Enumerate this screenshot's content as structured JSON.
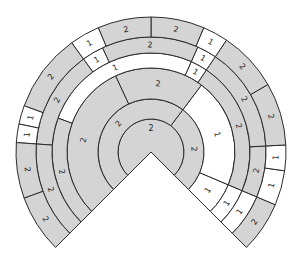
{
  "diagram": {
    "type": "concentric-ring-fan",
    "center": [
      151,
      152
    ],
    "sweep_degrees": [
      -45,
      225
    ],
    "colors": {
      "shaded": "#d4d4d4",
      "white": "#ffffff",
      "stroke": "#2b2b2b",
      "text": "#222222"
    },
    "rings": [
      {
        "name": "disc",
        "r0": 0,
        "r1": 33,
        "segments": [
          {
            "a0": -45,
            "a1": 225,
            "label": "2",
            "fill": "shaded"
          }
        ]
      },
      {
        "name": "ring-a",
        "r0": 33,
        "r1": 53,
        "segments": [
          {
            "a0": -45,
            "a1": 53,
            "label": "2",
            "fill": "shaded"
          },
          {
            "a0": 53,
            "a1": 225,
            "label": "2",
            "fill": "shaded"
          }
        ]
      },
      {
        "name": "ring-b",
        "r0": 53,
        "r1": 84,
        "segments": [
          {
            "a0": -45,
            "a1": -23,
            "label": "1",
            "fill": "white"
          },
          {
            "a0": -23,
            "a1": 53,
            "label": "1",
            "fill": "white"
          },
          {
            "a0": 53,
            "a1": 115,
            "label": "2",
            "fill": "shaded"
          },
          {
            "a0": 115,
            "a1": 225,
            "label": "2",
            "fill": "shaded"
          }
        ]
      },
      {
        "name": "ring-c",
        "r0": 84,
        "r1": 99,
        "segments": [
          {
            "a0": -45,
            "a1": -23,
            "label": "1",
            "fill": "white"
          },
          {
            "a0": -23,
            "a1": 56,
            "label": "2",
            "fill": "shaded"
          },
          {
            "a0": 56,
            "a1": 66,
            "label": "1",
            "fill": "white"
          },
          {
            "a0": 66,
            "a1": 160,
            "label": "1",
            "fill": "white"
          },
          {
            "a0": 160,
            "a1": 225,
            "label": "2",
            "fill": "shaded"
          }
        ]
      },
      {
        "name": "ring-d",
        "r0": 99,
        "r1": 115,
        "segments": [
          {
            "a0": -45,
            "a1": -23,
            "label": "1",
            "fill": "white"
          },
          {
            "a0": -23,
            "a1": 3,
            "label": "2",
            "fill": "shaded"
          },
          {
            "a0": 3,
            "a1": 56,
            "label": "2",
            "fill": "shaded"
          },
          {
            "a0": 56,
            "a1": 66,
            "label": "1",
            "fill": "white"
          },
          {
            "a0": 66,
            "a1": 115,
            "label": "2",
            "fill": "shaded"
          },
          {
            "a0": 115,
            "a1": 126,
            "label": "1",
            "fill": "white"
          },
          {
            "a0": 126,
            "a1": 176,
            "label": "2",
            "fill": "shaded"
          },
          {
            "a0": 176,
            "a1": 225,
            "label": "2",
            "fill": "shaded"
          }
        ]
      },
      {
        "name": "ring-e",
        "r0": 115,
        "r1": 135,
        "segments": [
          {
            "a0": -45,
            "a1": -23,
            "label": "2",
            "fill": "shaded"
          },
          {
            "a0": -23,
            "a1": -8,
            "label": "1",
            "fill": "white"
          },
          {
            "a0": -8,
            "a1": 3,
            "label": "1",
            "fill": "white"
          },
          {
            "a0": 3,
            "a1": 30,
            "label": "2",
            "fill": "shaded"
          },
          {
            "a0": 30,
            "a1": 56,
            "label": "2",
            "fill": "shaded"
          },
          {
            "a0": 56,
            "a1": 67,
            "label": "1",
            "fill": "white"
          },
          {
            "a0": 67,
            "a1": 90,
            "label": "2",
            "fill": "shaded"
          },
          {
            "a0": 90,
            "a1": 113,
            "label": "2",
            "fill": "shaded"
          },
          {
            "a0": 113,
            "a1": 126,
            "label": "1",
            "fill": "white"
          },
          {
            "a0": 126,
            "a1": 160,
            "label": "2",
            "fill": "shaded"
          },
          {
            "a0": 160,
            "a1": 168,
            "label": "1",
            "fill": "white"
          },
          {
            "a0": 168,
            "a1": 176,
            "label": "1",
            "fill": "white"
          },
          {
            "a0": 176,
            "a1": 200,
            "label": "2",
            "fill": "shaded"
          },
          {
            "a0": 200,
            "a1": 225,
            "label": "2",
            "fill": "shaded"
          }
        ]
      }
    ]
  }
}
